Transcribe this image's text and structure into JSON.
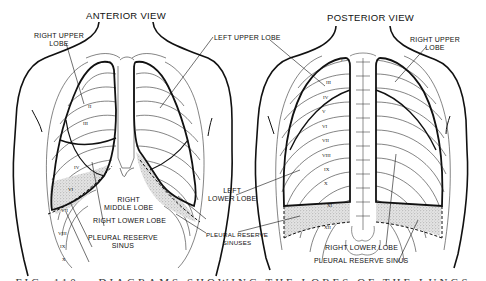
{
  "figure": {
    "views": [
      {
        "title": "ANTERIOR VIEW",
        "labels": {
          "right_upper_lobe": [
            "RIGHT UPPER",
            "LOBE"
          ],
          "left_upper_lobe": "LEFT UPPER LOBE",
          "right_middle_lobe": [
            "RIGHT",
            "MIDDLE LOBE"
          ],
          "right_lower_lobe": "RIGHT LOWER LOBE",
          "pleural_reserve_sinus": [
            "PLEURAL RESERVE",
            "SINUS"
          ]
        },
        "rib_numbers": [
          "II",
          "III",
          "IV",
          "VI",
          "VII",
          "VIII",
          "IX",
          "X"
        ]
      },
      {
        "title": "POSTERIOR VIEW",
        "labels": {
          "right_upper_lobe": [
            "RIGHT UPPER",
            "LOBE"
          ],
          "right_lower_lobe": "RIGHT LOWER LOBE",
          "pleural_reserve_sinus": "PLEURAL RESERVE SINUS"
        },
        "rib_numbers": [
          "I",
          "III",
          "IV",
          "V",
          "VI",
          "VII",
          "VIII",
          "IX",
          "X",
          "XI",
          "XII"
        ]
      }
    ],
    "shared_labels": {
      "left_lower_lobe": [
        "LEFT",
        "LOWER LOBE"
      ],
      "pleural_reserve_sinuses": [
        "PLEURAL RESERVE",
        "SINUSES"
      ]
    },
    "caption_partial": "FIG. 110.—DIAGRAMS SHOWING THE LOBES OF THE LUNGS"
  }
}
